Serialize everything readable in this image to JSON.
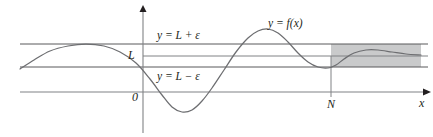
{
  "figure": {
    "background_color": "#ffffff",
    "width": 433,
    "height": 137
  },
  "labels": {
    "epsilon_upper": "y = L + ε",
    "epsilon_lower": "y = L − ε",
    "limit_value": "L",
    "function": "y = f(x)",
    "origin": "0",
    "n_marker": "N",
    "x_axis": "x"
  },
  "colors": {
    "curve": "#6d6e71",
    "axis": "#808285",
    "guide_line": "#58595b",
    "band_fill": "#c9cacb",
    "text": "#231f20"
  },
  "chart_data": {
    "type": "line",
    "title": "y = f(x)",
    "xlabel": "x",
    "ylabel": "",
    "grid": false,
    "legend_position": "none",
    "axes": {
      "x_axis_pixel_y": 92,
      "y_axis_pixel_x": 143,
      "x_axis_arrow": true,
      "y_axis_arrow": true,
      "x_axis_start_px": 20,
      "x_axis_end_px": 425
    },
    "guide_lines": [
      {
        "name": "y = L + ε",
        "pixel_y": 44,
        "x_start_px": 20,
        "x_end_px": 428
      },
      {
        "name": "y = L",
        "pixel_y": 56,
        "x_start_px": 143,
        "x_end_px": 428
      },
      {
        "name": "y = L − ε",
        "pixel_y": 67,
        "x_start_px": 20,
        "x_end_px": 428
      }
    ],
    "shaded_band": {
      "label": "|f(x) − L| < ε for x > N",
      "x_start_px": 331,
      "x_end_px": 421,
      "y_top_px": 44,
      "y_bottom_px": 67
    },
    "markers": [
      {
        "label": "N",
        "pixel_x": 331,
        "type": "vertical-line",
        "y_top_px": 56,
        "y_bottom_px": 97
      },
      {
        "label": "0",
        "pixel_x": 143,
        "type": "origin"
      }
    ],
    "curve_points_px": [
      [
        20,
        69
      ],
      [
        34,
        60
      ],
      [
        50,
        51
      ],
      [
        68,
        46
      ],
      [
        86,
        44
      ],
      [
        104,
        46
      ],
      [
        120,
        52
      ],
      [
        136,
        63
      ],
      [
        150,
        79
      ],
      [
        162,
        95
      ],
      [
        172,
        107
      ],
      [
        182,
        112
      ],
      [
        192,
        110
      ],
      [
        202,
        101
      ],
      [
        212,
        88
      ],
      [
        224,
        70
      ],
      [
        236,
        52
      ],
      [
        248,
        38
      ],
      [
        258,
        31
      ],
      [
        268,
        29
      ],
      [
        278,
        33
      ],
      [
        288,
        42
      ],
      [
        298,
        53
      ],
      [
        308,
        62
      ],
      [
        318,
        67
      ],
      [
        328,
        68
      ],
      [
        336,
        65
      ],
      [
        344,
        59
      ],
      [
        354,
        53
      ],
      [
        366,
        50
      ],
      [
        378,
        50
      ],
      [
        392,
        52
      ],
      [
        406,
        54
      ],
      [
        421,
        55
      ]
    ]
  }
}
